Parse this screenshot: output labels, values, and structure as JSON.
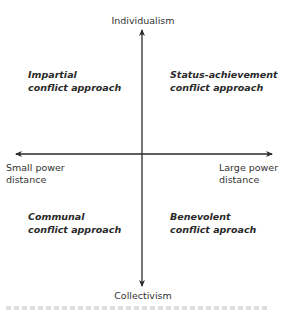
{
  "diagram": {
    "type": "quadrant-matrix",
    "axes": {
      "vertical": {
        "top": "Individualism",
        "bottom": "Collectivism"
      },
      "horizontal": {
        "left": [
          "Small power",
          "distance"
        ],
        "right": [
          "Large power",
          "distance"
        ]
      }
    },
    "quadrants": {
      "top_left": [
        "Impartial",
        "conflict approach"
      ],
      "top_right": [
        "Status-achievement",
        "conflict approach"
      ],
      "bottom_left": [
        "Communal",
        "conflict approach"
      ],
      "bottom_right": [
        "Benevolent",
        "conflict aproach"
      ]
    },
    "colors": {
      "axis": "#2a2a2a",
      "text": "#333333",
      "background": "#ffffff"
    }
  }
}
